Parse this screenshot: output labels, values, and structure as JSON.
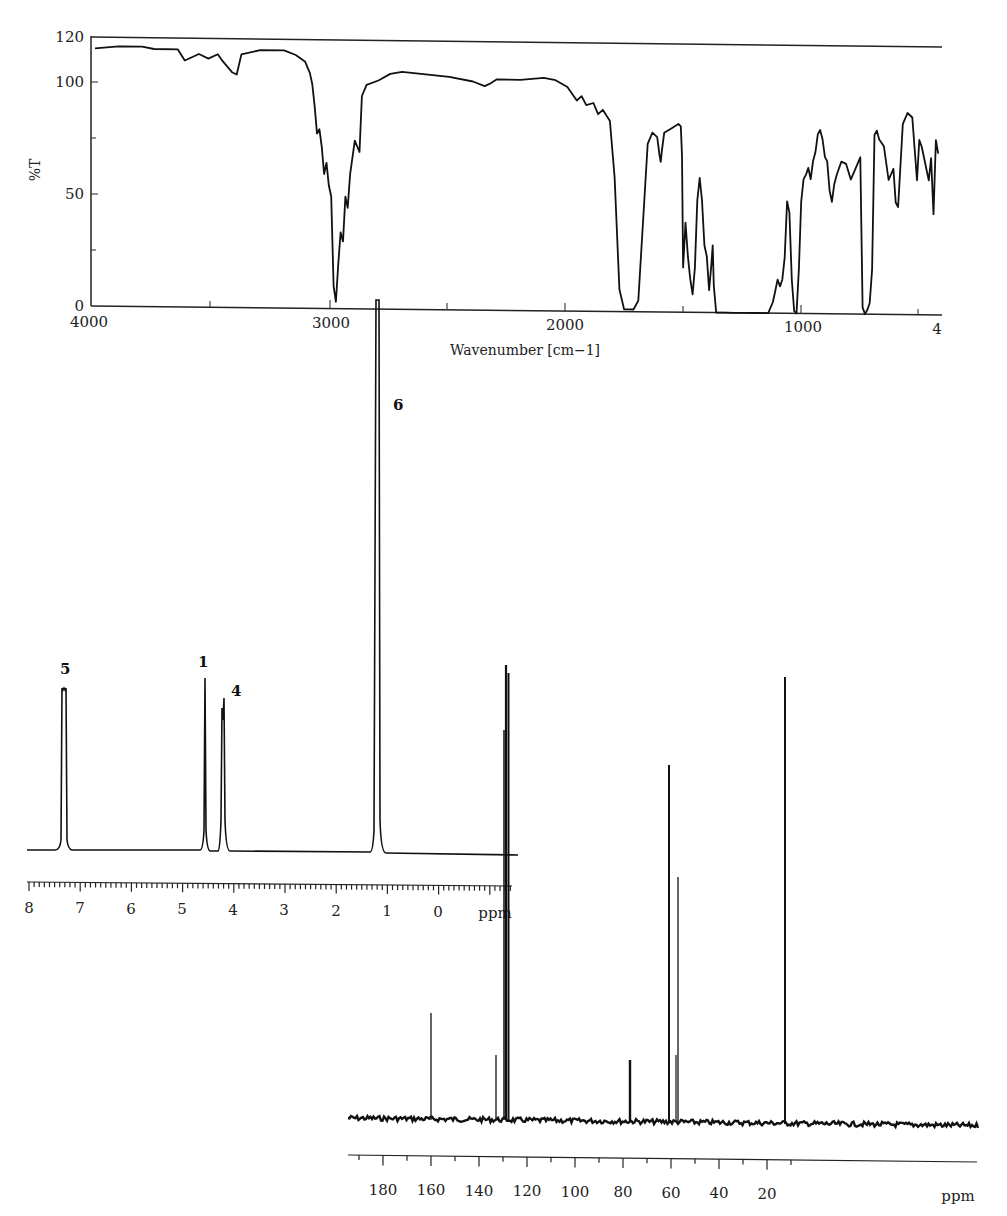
{
  "chart_data": [
    {
      "id": "ir",
      "type": "line",
      "title": "",
      "xlabel": "Wavenumber [cm−1]",
      "ylabel": "%T",
      "xlim": [
        4000,
        400
      ],
      "ylim": [
        0,
        120
      ],
      "x_ticks": [
        4000,
        3000,
        2000,
        1000,
        400
      ],
      "x_tick_labels": [
        "4000",
        "3000",
        "2000",
        "1000",
        "4"
      ],
      "y_ticks": [
        0,
        50,
        100,
        120
      ],
      "y_tick_labels": [
        "0",
        "50",
        "100",
        "120"
      ],
      "grid": false,
      "series": [
        {
          "name": "IR spectrum",
          "x": [
            4000,
            3900,
            3800,
            3750,
            3650,
            3620,
            3560,
            3520,
            3480,
            3460,
            3420,
            3400,
            3380,
            3300,
            3200,
            3150,
            3110,
            3090,
            3080,
            3070,
            3060,
            3050,
            3040,
            3030,
            3020,
            3010,
            3000,
            2990,
            2980,
            2970,
            2960,
            2950,
            2940,
            2930,
            2920,
            2900,
            2880,
            2870,
            2850,
            2800,
            2750,
            2700,
            2600,
            2500,
            2400,
            2350,
            2330,
            2300,
            2200,
            2100,
            2050,
            2000,
            1960,
            1940,
            1920,
            1890,
            1870,
            1850,
            1820,
            1800,
            1780,
            1760,
            1740,
            1720,
            1700,
            1680,
            1660,
            1640,
            1620,
            1610,
            1605,
            1600,
            1590,
            1560,
            1530,
            1520,
            1515,
            1510,
            1500,
            1490,
            1480,
            1470,
            1460,
            1450,
            1440,
            1430,
            1420,
            1410,
            1400,
            1390,
            1385,
            1380,
            1370,
            1360,
            1350,
            1340,
            1300,
            1250,
            1200,
            1150,
            1130,
            1120,
            1110,
            1100,
            1090,
            1080,
            1070,
            1060,
            1050,
            1040,
            1030,
            1020,
            1010,
            1000,
            990,
            980,
            970,
            960,
            950,
            940,
            930,
            920,
            910,
            900,
            890,
            880,
            870,
            860,
            850,
            840,
            820,
            800,
            780,
            760,
            750,
            740,
            730,
            720,
            710,
            700,
            690,
            680,
            660,
            640,
            620,
            610,
            600,
            580,
            560,
            540,
            520,
            510,
            500,
            490,
            480,
            470,
            460,
            450,
            440,
            430
          ],
          "y": [
            115,
            116,
            116,
            115,
            115,
            110,
            113,
            111,
            113,
            110,
            105,
            104,
            113,
            115,
            115,
            113,
            110,
            105,
            100,
            90,
            78,
            80,
            72,
            60,
            65,
            55,
            50,
            10,
            3,
            20,
            34,
            30,
            50,
            45,
            60,
            75,
            70,
            95,
            100,
            102,
            105,
            106,
            105,
            104,
            102,
            100,
            101,
            103,
            103,
            104,
            103,
            100,
            94,
            96,
            92,
            93,
            88,
            90,
            85,
            60,
            10,
            1,
            1,
            1,
            5,
            40,
            75,
            80,
            78,
            70,
            67,
            72,
            80,
            82,
            84,
            83,
            70,
            20,
            40,
            25,
            15,
            8,
            20,
            50,
            60,
            50,
            30,
            25,
            10,
            22,
            30,
            12,
            0,
            0,
            0,
            0,
            0,
            0,
            0,
            0,
            5,
            10,
            15,
            12,
            15,
            25,
            50,
            45,
            15,
            1,
            0,
            20,
            50,
            60,
            62,
            65,
            60,
            68,
            72,
            80,
            82,
            78,
            70,
            68,
            55,
            50,
            58,
            62,
            65,
            68,
            67,
            60,
            65,
            70,
            3,
            0,
            2,
            5,
            20,
            80,
            82,
            78,
            75,
            60,
            65,
            50,
            48,
            85,
            90,
            88,
            60,
            78,
            75,
            70,
            65,
            60,
            70,
            45,
            78,
            72
          ]
        }
      ]
    },
    {
      "id": "h-nmr",
      "type": "line",
      "title": "",
      "xlabel": "ppm",
      "xlim": [
        8.2,
        -1.0
      ],
      "x_ticks": [
        8,
        7,
        6,
        5,
        4,
        3,
        2,
        1,
        0
      ],
      "x_tick_labels": [
        "8",
        "7",
        "6",
        "5",
        "4",
        "3",
        "2",
        "1",
        "0"
      ],
      "grid": false,
      "peaks": [
        {
          "label": "5",
          "ppm": 7.35,
          "relative_height": 0.36,
          "multiplicity": "multiplet"
        },
        {
          "label": "1",
          "ppm": 4.62,
          "relative_height": 0.37,
          "multiplicity": "singlet"
        },
        {
          "label": "4",
          "ppm": 4.2,
          "relative_height": 0.34,
          "multiplicity": "quartet"
        },
        {
          "label": "6",
          "ppm": 1.25,
          "relative_height": 1.0,
          "multiplicity": "triplet"
        }
      ]
    },
    {
      "id": "c-nmr",
      "type": "line",
      "title": "",
      "xlabel": "ppm",
      "xlim": [
        195,
        0
      ],
      "x_ticks": [
        180,
        160,
        140,
        120,
        100,
        80,
        60,
        40,
        20
      ],
      "x_tick_labels": [
        "180",
        "160",
        "140",
        "120",
        "100",
        "80",
        "60",
        "40",
        "20"
      ],
      "grid": false,
      "peaks": [
        {
          "ppm": 168.0,
          "relative_height": 0.45
        },
        {
          "ppm": 132.5,
          "relative_height": 0.27
        },
        {
          "ppm": 128.5,
          "relative_height": 1.0
        },
        {
          "ppm": 128.0,
          "relative_height": 0.93
        },
        {
          "ppm": 77.0,
          "relative_height": 0.22
        },
        {
          "ppm": 61.5,
          "relative_height": 0.76
        },
        {
          "ppm": 57.5,
          "relative_height": 0.53
        },
        {
          "ppm": 14.0,
          "relative_height": 0.95
        }
      ]
    }
  ],
  "ir": {
    "ylabel": "%T",
    "xlabel": "Wavenumber [cm−1]",
    "y_ticks": [
      "120",
      "100",
      "50",
      "0"
    ],
    "x_ticks": [
      "4000",
      "3000",
      "2000",
      "1000",
      "4"
    ]
  },
  "hnmr": {
    "peak_labels": [
      "5",
      "1",
      "4",
      "6"
    ],
    "x_ticks": [
      "8",
      "7",
      "6",
      "5",
      "4",
      "3",
      "2",
      "1",
      "0"
    ],
    "unit": "ppm"
  },
  "cnmr": {
    "x_ticks": [
      "180",
      "160",
      "140",
      "120",
      "100",
      "80",
      "60",
      "40",
      "20"
    ],
    "unit": "ppm"
  }
}
